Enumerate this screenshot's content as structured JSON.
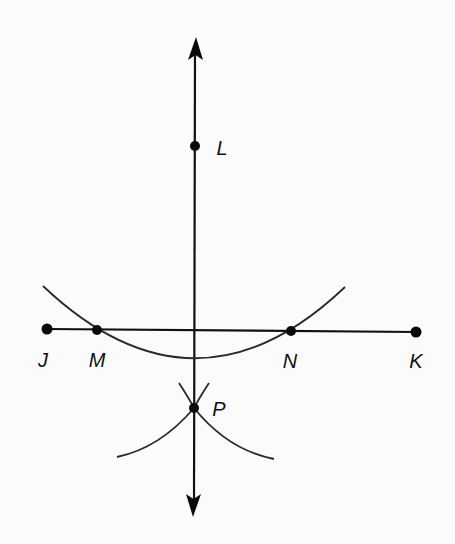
{
  "diagram": {
    "title": "",
    "colors": {
      "background": "#fbfbfb",
      "ink": "#111111",
      "arc": "#2a2a2a"
    },
    "points": {
      "L": {
        "label": "L",
        "x": 195,
        "y": 146,
        "label_x": 222,
        "label_y": 148
      },
      "J": {
        "label": "J",
        "x": 47,
        "y": 329,
        "label_x": 43,
        "label_y": 360
      },
      "M": {
        "label": "M",
        "x": 97,
        "y": 330,
        "label_x": 97,
        "label_y": 360
      },
      "N": {
        "label": "N",
        "x": 291,
        "y": 331,
        "label_x": 290,
        "label_y": 361
      },
      "K": {
        "label": "K",
        "x": 416,
        "y": 332,
        "label_x": 416,
        "label_y": 361
      },
      "P": {
        "label": "P",
        "x": 194,
        "y": 408,
        "label_x": 219,
        "label_y": 409
      }
    },
    "lines": {
      "perpendicular": {
        "x1": 195,
        "y1": 40,
        "x2": 194,
        "y2": 514,
        "arrows": "both"
      },
      "segment_JK": {
        "from": "J",
        "to": "K"
      }
    },
    "arcs": {
      "large_arc_center_L": {
        "start": [
          43,
          286
        ],
        "control": [
          195,
          430
        ],
        "end": [
          345,
          287
        ]
      },
      "small_arc_center_N": {
        "start": [
          179,
          383
        ],
        "control": [
          195,
          440
        ],
        "end": [
          117,
          457
        ]
      },
      "small_arc_center_M": {
        "start": [
          209,
          383
        ],
        "control": [
          195,
          440
        ],
        "end": [
          274,
          459
        ]
      }
    }
  }
}
